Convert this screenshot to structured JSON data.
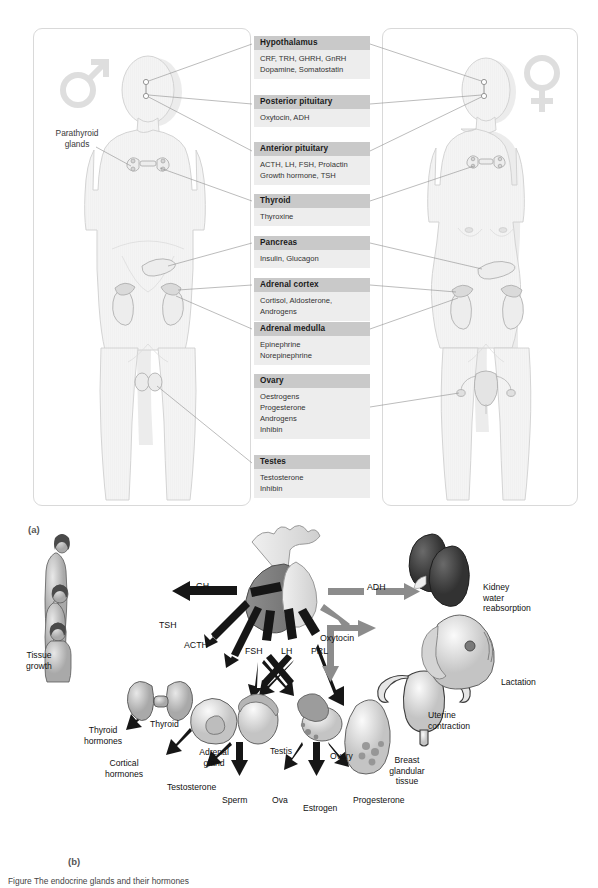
{
  "figure": {
    "panel_a_letter": "(a)",
    "panel_b_letter": "(b)",
    "caption": "Figure  The endocrine glands and their hormones"
  },
  "colors": {
    "header_bar": "#c9c9c9",
    "body_bar": "#ededed",
    "card_border": "#d9d9d9",
    "body_fill": "#f2f2f2",
    "body_stroke": "#cfcfcf",
    "leader_line": "#808080",
    "gender_symbol": "#dedede",
    "arrow_dark": "#1a1a1a",
    "arrow_gray": "#8a8a8a"
  },
  "panel_a": {
    "male_symbol": "male-symbol",
    "female_symbol": "female-symbol",
    "parathyroid_label": [
      "Parathyroid",
      "glands"
    ],
    "glands": [
      {
        "name": "Hypothalamus",
        "hormones": [
          "CRF, TRH, GHRH, GnRH",
          "Dopamine, Somatostatin"
        ]
      },
      {
        "name": "Posterior pituitary",
        "hormones": [
          "Oxytocin, ADH"
        ]
      },
      {
        "name": "Anterior pituitary",
        "hormones": [
          "ACTH, LH, FSH, Prolactin",
          "Growth hormone, TSH"
        ]
      },
      {
        "name": "Thyroid",
        "hormones": [
          "Thyroxine"
        ]
      },
      {
        "name": "Pancreas",
        "hormones": [
          "Insulin, Glucagon"
        ]
      },
      {
        "name": "Adrenal cortex",
        "hormones": [
          "Cortisol, Aldosterone,",
          "Androgens"
        ]
      },
      {
        "name": "Adrenal medulla",
        "hormones": [
          "Epinephrine",
          "Norepinephrine"
        ]
      },
      {
        "name": "Ovary",
        "hormones": [
          "Oestrogens",
          "Progesterone",
          "Androgens",
          "Inhibin"
        ]
      },
      {
        "name": "Testes",
        "hormones": [
          "Testosterone",
          "Inhibin"
        ]
      }
    ]
  },
  "panel_b": {
    "source_organ": "pituitary-gland",
    "hormones": [
      {
        "label": "GH",
        "style": "dark"
      },
      {
        "label": "TSH",
        "style": "dark"
      },
      {
        "label": "ACTH",
        "style": "dark"
      },
      {
        "label": "FSH",
        "style": "dark"
      },
      {
        "label": "LH",
        "style": "dark"
      },
      {
        "label": "PRL",
        "style": "dark"
      },
      {
        "label": "ADH",
        "style": "gray"
      },
      {
        "label": "Oxytocin",
        "style": "gray"
      }
    ],
    "targets": [
      {
        "label": "Tissue\ngrowth",
        "icon": "human-growth-stages-icon"
      },
      {
        "label": "Thyroid",
        "icon": "thyroid-gland-icon"
      },
      {
        "label": "Thyroid\nhormones",
        "icon": "none"
      },
      {
        "label": "Adrenal\ngland",
        "icon": "adrenal-gland-icon"
      },
      {
        "label": "Cortical\nhormones",
        "icon": "none"
      },
      {
        "label": "Testis",
        "icon": "testis-icon"
      },
      {
        "label": "Testosterone",
        "icon": "none"
      },
      {
        "label": "Sperm",
        "icon": "none"
      },
      {
        "label": "Ovary",
        "icon": "ovary-icon"
      },
      {
        "label": "Ova",
        "icon": "none"
      },
      {
        "label": "Estrogen",
        "icon": "none"
      },
      {
        "label": "Progesterone",
        "icon": "none"
      },
      {
        "label": "Breast\nglandular\ntissue",
        "icon": "breast-icon"
      },
      {
        "label": "Uterine\ncontraction",
        "icon": "uterus-icon"
      },
      {
        "label": "Lactation",
        "icon": "lactating-breast-icon"
      },
      {
        "label": "Kidney\nwater\nreabsorption",
        "icon": "kidney-icon"
      }
    ]
  }
}
